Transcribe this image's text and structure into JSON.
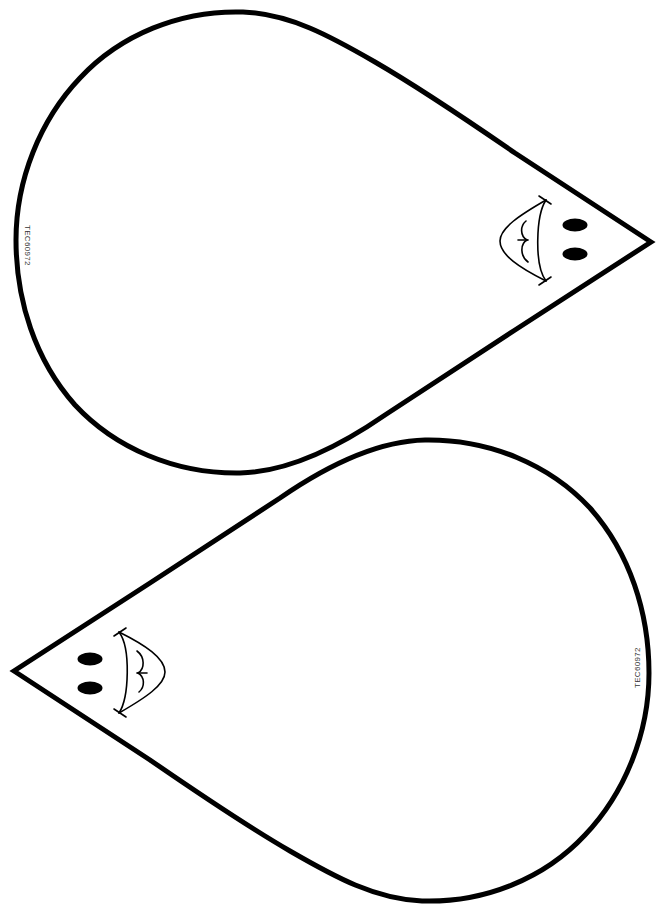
{
  "page": {
    "background": "#ffffff",
    "line_color": "#000000"
  },
  "shapes": [
    {
      "name": "top-teardrop",
      "tip_direction": "right",
      "code_label": "TEC60972",
      "face": {
        "eyes": 2,
        "mouth": "smiling-open-mouth"
      }
    },
    {
      "name": "bottom-teardrop",
      "tip_direction": "left",
      "code_label": "TEC60972",
      "face": {
        "eyes": 2,
        "mouth": "smiling-open-mouth"
      }
    }
  ]
}
